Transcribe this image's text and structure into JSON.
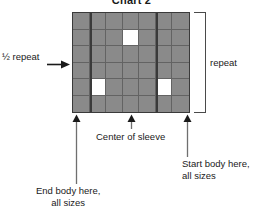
{
  "chart_data": {
    "type": "heatmap",
    "title": "Chart 2",
    "columns": 7,
    "rows": 6,
    "xlabel": "",
    "ylabel": "",
    "grid": true,
    "legend": "none",
    "cell_values": [
      [
        0,
        0,
        0,
        0,
        0,
        0,
        0
      ],
      [
        0,
        0,
        0,
        1,
        0,
        0,
        0
      ],
      [
        0,
        0,
        0,
        0,
        0,
        0,
        0
      ],
      [
        0,
        0,
        0,
        0,
        0,
        0,
        0
      ],
      [
        0,
        1,
        0,
        0,
        0,
        1,
        0
      ],
      [
        0,
        0,
        0,
        0,
        0,
        0,
        0
      ]
    ],
    "value_legend": {
      "0": "shaded stitch",
      "1": "white stitch"
    },
    "section_dividers_after_column": [
      1,
      5
    ],
    "colors": {
      "shaded_cell": "#8a8a8a",
      "white_cell": "#ffffff",
      "gridline": "#636363",
      "border": "#3a3a3a",
      "text": "#1a1a1a"
    },
    "annotations": [
      {
        "name": "half-repeat",
        "text": "½ repeat",
        "side": "left",
        "points_to": "left edge of chart"
      },
      {
        "name": "repeat",
        "text": "repeat",
        "side": "right",
        "points_to": "full chart height"
      },
      {
        "name": "center-of-sleeve",
        "text": "Center of sleeve",
        "side": "bottom",
        "column": 4
      },
      {
        "name": "start-body",
        "text_line1": "Start body here,",
        "text_line2": "all sizes",
        "side": "bottom",
        "column": 7
      },
      {
        "name": "end-body",
        "text_line1": "End body here,",
        "text_line2": "all sizes",
        "side": "bottom",
        "column": 1
      }
    ]
  },
  "title": "Chart 2",
  "labels": {
    "half_repeat": "½ repeat",
    "repeat": "repeat",
    "center_of_sleeve": "Center of sleeve",
    "start_body_line1": "Start body here,",
    "start_body_line2": "all sizes",
    "end_body_line1": "End body here,",
    "end_body_line2": "all sizes"
  },
  "icons": {
    "half_repeat_arrow": "arrow-right-icon",
    "up_arrow": "arrow-up-icon"
  }
}
